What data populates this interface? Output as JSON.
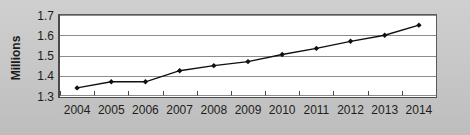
{
  "chart_data": {
    "type": "line",
    "title": "",
    "xlabel": "",
    "ylabel": "Millions",
    "categories": [
      "2004",
      "2005",
      "2006",
      "2007",
      "2008",
      "2009",
      "2010",
      "2011",
      "2012",
      "2013",
      "2014"
    ],
    "values": [
      1.34,
      1.37,
      1.37,
      1.425,
      1.45,
      1.47,
      1.505,
      1.535,
      1.57,
      1.6,
      1.65
    ],
    "series": [
      {
        "name": "",
        "values": [
          1.34,
          1.37,
          1.37,
          1.425,
          1.45,
          1.47,
          1.505,
          1.535,
          1.57,
          1.6,
          1.65
        ]
      }
    ],
    "ylim": [
      1.3,
      1.7
    ],
    "yticks": [
      "1.3",
      "1.4",
      "1.5",
      "1.6",
      "1.7"
    ],
    "ytick_values": [
      1.3,
      1.4,
      1.5,
      1.6,
      1.7
    ],
    "xticks": [
      "2004",
      "2005",
      "2006",
      "2007",
      "2008",
      "2009",
      "2010",
      "2011",
      "2012",
      "2013",
      "2014"
    ],
    "grid": true,
    "grid_axis": "y",
    "legend": false,
    "legend_position": "none",
    "marker": "diamond",
    "line_color": "#101010",
    "marker_color": "#101010",
    "plot_background": "#ffffff",
    "figure_background": "#c9c9c9",
    "gridline_color": "#8c8c8c",
    "axis_color": "#4a4a4a",
    "text_color": "#1d1d1d"
  }
}
